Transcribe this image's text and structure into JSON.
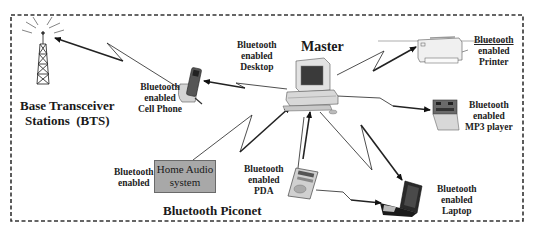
{
  "diagram": {
    "title": "Bluetooth Piconet",
    "master_label": "Master",
    "bts": {
      "line1": "Base Transceiver",
      "line2": "Stations  (BTS)"
    },
    "devices": [
      {
        "id": "desktop",
        "lines": [
          "Bluetooth",
          "enabled",
          "Desktop"
        ],
        "role": "master"
      },
      {
        "id": "cell_phone",
        "lines": [
          "Bluetooth",
          "enabled",
          "Cell Phone"
        ]
      },
      {
        "id": "printer",
        "lines": [
          "Bluetooth",
          "enabled",
          "Printer"
        ]
      },
      {
        "id": "mp3_player",
        "lines": [
          "Bluetooth",
          "enabled",
          "MP3 player"
        ]
      },
      {
        "id": "laptop",
        "lines": [
          "Bluetooth",
          "enabled",
          "Laptop"
        ]
      },
      {
        "id": "pda",
        "lines": [
          "Bluetooth",
          "enabled",
          "PDA"
        ]
      },
      {
        "id": "home_audio",
        "lines": [
          "Bluetooth",
          "enabled"
        ],
        "box_lines": [
          "Home Audio",
          "system"
        ]
      }
    ],
    "links": [
      {
        "from": "cell_phone",
        "to": "bts"
      },
      {
        "from": "desktop",
        "to": "cell_phone"
      },
      {
        "from": "desktop",
        "to": "printer"
      },
      {
        "from": "desktop",
        "to": "mp3_player"
      },
      {
        "from": "desktop",
        "to": "laptop"
      },
      {
        "from": "pda",
        "to": "desktop"
      },
      {
        "from": "home_audio",
        "to": "desktop"
      },
      {
        "from": "pda",
        "to": "laptop"
      }
    ],
    "colors": {
      "border": "#333333",
      "text": "#222222",
      "audio_box_fill": "#a8a8a8",
      "line": "#333333"
    }
  }
}
